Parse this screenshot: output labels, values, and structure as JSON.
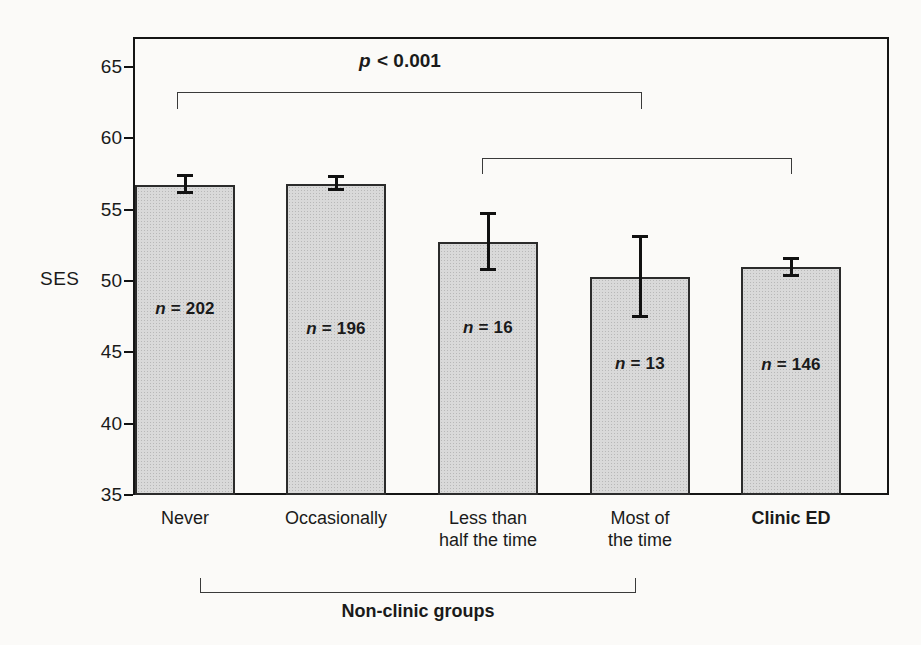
{
  "figure": {
    "background_color": "#fbfaf8",
    "frame_color": "#151515",
    "bar_fill_color": "#d9d9d9",
    "bar_border_color": "#2b2b2b",
    "text_color": "#1a1a1a"
  },
  "chart_data": {
    "type": "bar",
    "title": "",
    "xlabel": "",
    "ylabel": "SES",
    "ylim": [
      35,
      67
    ],
    "yticks": [
      65,
      60,
      55,
      50,
      45,
      40,
      35
    ],
    "grid": false,
    "legend": false,
    "categories": [
      "Never",
      "Occasionally",
      "Less than half the time",
      "Most of the time",
      "Clinic ED"
    ],
    "category_lines": [
      [
        "Never"
      ],
      [
        "Occasionally"
      ],
      [
        "Less than",
        "half the time"
      ],
      [
        "Most of",
        "the time"
      ],
      [
        "Clinic ED"
      ]
    ],
    "category_bold": [
      false,
      false,
      false,
      false,
      true
    ],
    "series": [
      {
        "name": "SES mean",
        "values": [
          56.7,
          56.8,
          52.7,
          50.3,
          51.0
        ],
        "error_low": [
          56.2,
          56.4,
          50.8,
          47.5,
          50.4
        ],
        "error_high": [
          57.4,
          57.3,
          54.7,
          53.1,
          51.6
        ]
      }
    ],
    "n_labels": [
      "n = 202",
      "n = 196",
      "n = 16",
      "n = 13",
      "n = 146"
    ],
    "annotations": {
      "p_label": "p < 0.001",
      "sig_brackets": [
        {
          "from": "Never",
          "to": "Most of the time"
        },
        {
          "from": "Less than half the time",
          "to": "Clinic ED"
        }
      ],
      "group_bracket": {
        "label": "Non-clinic groups",
        "from": "Never",
        "to": "Most of the time"
      }
    }
  }
}
